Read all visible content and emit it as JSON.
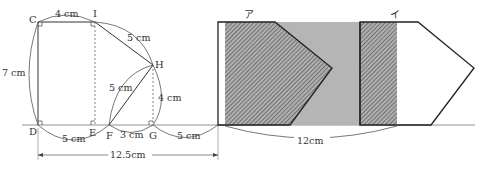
{
  "diagram": {
    "points": {
      "C": "C",
      "I": "I",
      "H": "H",
      "D": "D",
      "E": "E",
      "F": "F",
      "G": "G"
    },
    "measures": {
      "CI": "4 cm",
      "IH": "5 cm",
      "CD": "7 cm",
      "FH": "5 cm",
      "HG": "4 cm",
      "DF": "5 cm",
      "FG": "3 cm",
      "G_to_shape": "5 cm",
      "total_left": "12.5cm",
      "slide_distance": "12cm"
    },
    "shape_labels": {
      "first": "ア",
      "second": "イ"
    },
    "colors": {
      "line": "#222222",
      "gray_fill": "#b5b5b5",
      "hatch_fill": "#8a8a8a",
      "text": "#333333"
    }
  }
}
